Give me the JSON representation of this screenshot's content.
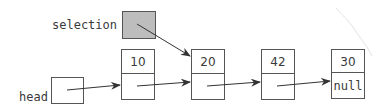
{
  "diagram": {
    "type": "linked-list",
    "labels": {
      "selection": "selection",
      "head": "head"
    },
    "nodes": [
      {
        "value": "10",
        "next": ""
      },
      {
        "value": "20",
        "next": ""
      },
      {
        "value": "42",
        "next": ""
      },
      {
        "value": "30",
        "next": "null"
      }
    ],
    "colors": {
      "stroke": "#3a3a3a",
      "selection_fill": "#bdbdbd",
      "background": "#ffffff"
    }
  }
}
